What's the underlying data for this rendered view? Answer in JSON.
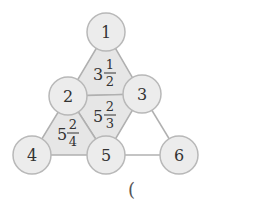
{
  "diagram": {
    "nodes": [
      {
        "id": "1",
        "label": "1",
        "x": 106,
        "y": 32
      },
      {
        "id": "2",
        "label": "2",
        "x": 68,
        "y": 96
      },
      {
        "id": "3",
        "label": "3",
        "x": 142,
        "y": 94
      },
      {
        "id": "4",
        "label": "4",
        "x": 32,
        "y": 155
      },
      {
        "id": "5",
        "label": "5",
        "x": 106,
        "y": 155
      },
      {
        "id": "6",
        "label": "6",
        "x": 179,
        "y": 155
      }
    ],
    "regions": [
      {
        "name": "top-triangle",
        "whole": "3",
        "numerator": "1",
        "denominator": "2"
      },
      {
        "name": "middle-triangle",
        "whole": "5",
        "numerator": "2",
        "denominator": "3"
      },
      {
        "name": "left-triangle",
        "whole": "5",
        "numerator": "2",
        "denominator": "4"
      }
    ],
    "answer_paren": "("
  },
  "colors": {
    "node_fill": "#ececec",
    "node_stroke": "#b8b8b8",
    "region_fill": "#e6e6e6",
    "line": "#b0b0b0",
    "text": "#333333"
  }
}
